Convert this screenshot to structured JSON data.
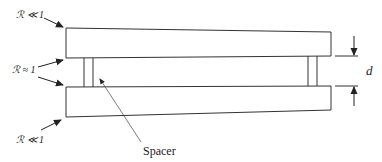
{
  "diagram": {
    "labels": {
      "ratio_top": "ℛ ≪ 1",
      "ratio_middle": "ℛ ≈ 1",
      "ratio_bottom": "ℛ ≪ 1",
      "gap": "d",
      "spacer": "Spacer"
    },
    "colors": {
      "stroke": "#333333",
      "background": "#ffffff"
    }
  }
}
